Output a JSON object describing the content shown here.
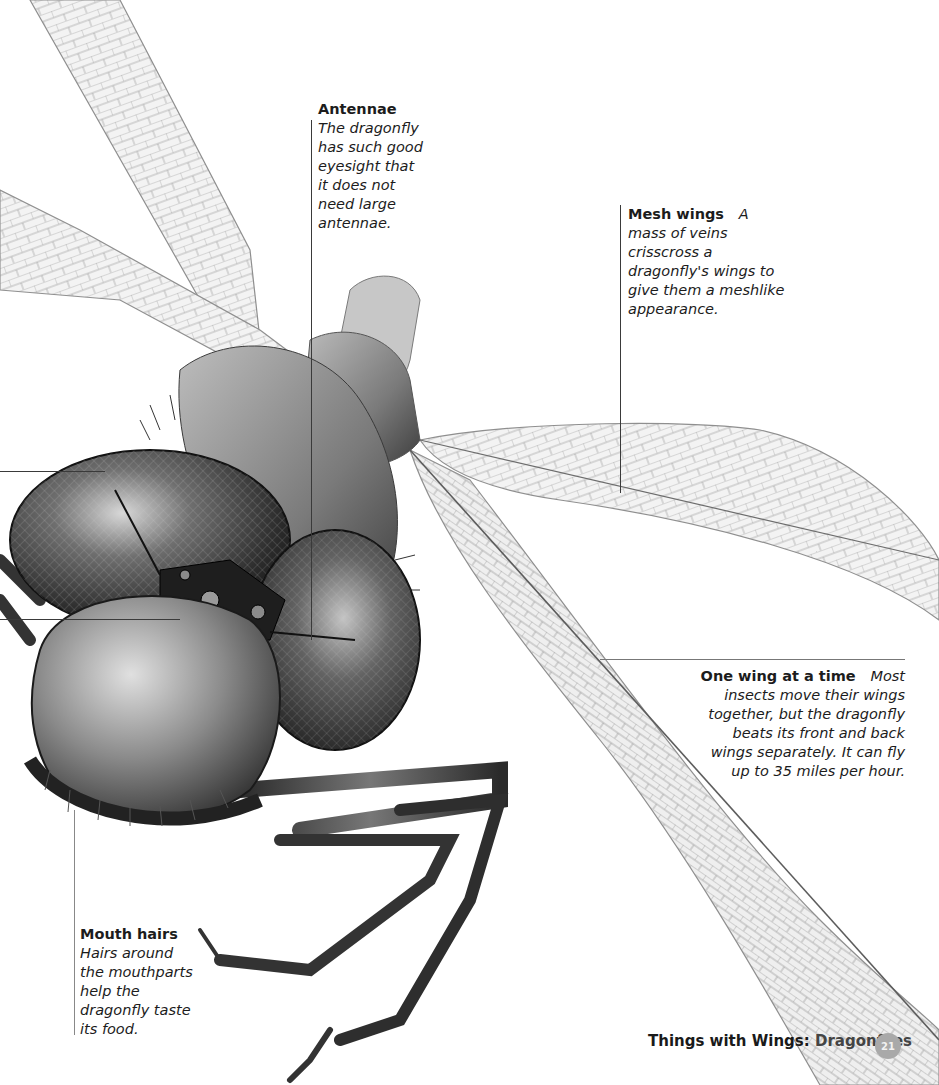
{
  "page": {
    "footer": {
      "section": "Things with Wings:",
      "topic": "Dragonflies",
      "page_number": "21"
    },
    "illustration": {
      "subject": "dragonfly-head-closeup",
      "palette": {
        "wing_vein": "#9a9a9a",
        "wing_fill": "#f1f1f1",
        "eye_dark": "#2b2b2b",
        "eye_mid": "#6e6e6e",
        "body": "#8c8c8c",
        "leader_line": "#3a3a3a",
        "badge": "#a9a9a9"
      }
    },
    "callouts": [
      {
        "id": "antennae",
        "title": "Antennae",
        "body": "The dragonfly has such good eyesight that it does not need large antennae."
      },
      {
        "id": "mesh-wings",
        "title": "Mesh wings",
        "body": "A mass of veins crisscross a dragonfly's wings to give them a meshlike appearance."
      },
      {
        "id": "one-wing-at-a-time",
        "title": "One wing at a time",
        "body": "Most insects move their wings together, but the dragonfly beats its front and back wings separately. It can fly up to 35 miles per hour."
      },
      {
        "id": "mouth-hairs",
        "title": "Mouth hairs",
        "body": "Hairs around the mouthparts help the dragonfly taste its food."
      }
    ]
  }
}
